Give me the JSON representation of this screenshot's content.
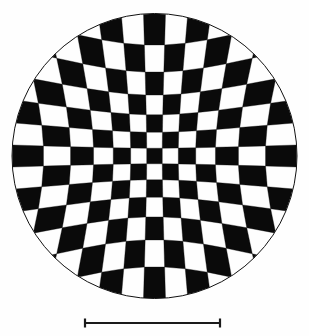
{
  "figure": {
    "name": "distorted-checkerboard-disk",
    "kind": "scientific-figure",
    "background_color": "#fefefe",
    "foreground_color": "#0a0a0a",
    "caption": "",
    "title": ""
  },
  "disk": {
    "name": "checkerboard-disk",
    "center_x": 154.5,
    "center_y": 156.0,
    "radius": 143.0,
    "outline_color": "#111111",
    "outline_width": 1.0,
    "fill_color": "#ffffff"
  },
  "checkerboard": {
    "name": "pincushion-checkerboard",
    "rows": 13,
    "cols": 13,
    "dark_color": "#0a0a0a",
    "light_color": "#fdfdfd",
    "distortion_model": "pincushion",
    "distortion_k": 0.42,
    "center_parity": 0,
    "description": "Radially distorted checkerboard: square cells are compressed near the center and expand toward the disk periphery."
  },
  "scale_bar": {
    "name": "scale-bar",
    "x_start": 85,
    "x_end": 220,
    "y": 323,
    "length_px": 135,
    "line_width": 2,
    "cap_height": 9,
    "color": "#1a1a1a",
    "label": ""
  }
}
